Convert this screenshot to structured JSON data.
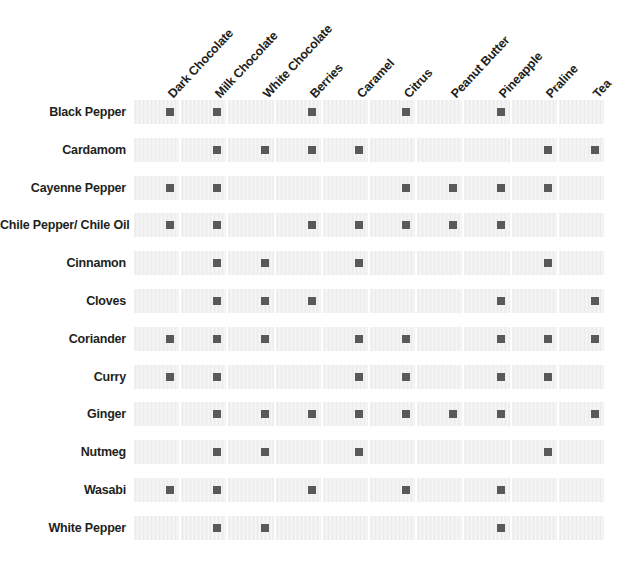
{
  "chart_data": {
    "type": "heatmap",
    "title": "",
    "xlabel": "",
    "ylabel": "",
    "grid": "on",
    "legend": "none",
    "marker_color": "#58595b",
    "cell_color": "#ececec",
    "text_color": "#231f20",
    "columns": [
      "Dark Chocolate",
      "Milk Chocolate",
      "White Chocolate",
      "Berries",
      "Caramel",
      "Citrus",
      "Peanut Butter",
      "Pineapple",
      "Praline",
      "Tea"
    ],
    "rows": [
      "Black Pepper",
      "Cardamom",
      "Cayenne Pepper",
      "Chile Pepper/ Chile Oil",
      "Cinnamon",
      "Cloves",
      "Coriander",
      "Curry",
      "Ginger",
      "Nutmeg",
      "Wasabi",
      "White Pepper"
    ],
    "values": [
      [
        1,
        1,
        0,
        1,
        0,
        1,
        0,
        1,
        0,
        0
      ],
      [
        0,
        1,
        1,
        1,
        1,
        0,
        0,
        0,
        1,
        1
      ],
      [
        1,
        1,
        0,
        0,
        0,
        1,
        1,
        1,
        1,
        0
      ],
      [
        1,
        1,
        0,
        1,
        1,
        1,
        1,
        1,
        0,
        0
      ],
      [
        0,
        1,
        1,
        0,
        1,
        0,
        0,
        0,
        1,
        0
      ],
      [
        0,
        1,
        1,
        1,
        0,
        0,
        0,
        1,
        0,
        1
      ],
      [
        1,
        1,
        1,
        0,
        1,
        1,
        0,
        1,
        1,
        1
      ],
      [
        1,
        1,
        0,
        0,
        1,
        1,
        0,
        1,
        1,
        0
      ],
      [
        0,
        1,
        1,
        1,
        1,
        1,
        1,
        1,
        0,
        1
      ],
      [
        0,
        1,
        1,
        0,
        1,
        0,
        0,
        0,
        1,
        0
      ],
      [
        1,
        1,
        0,
        1,
        0,
        1,
        0,
        1,
        0,
        0
      ],
      [
        0,
        1,
        1,
        0,
        0,
        0,
        0,
        1,
        0,
        0
      ]
    ],
    "value_legend": {
      "1": "pairs well",
      "0": "no pairing marked"
    }
  }
}
